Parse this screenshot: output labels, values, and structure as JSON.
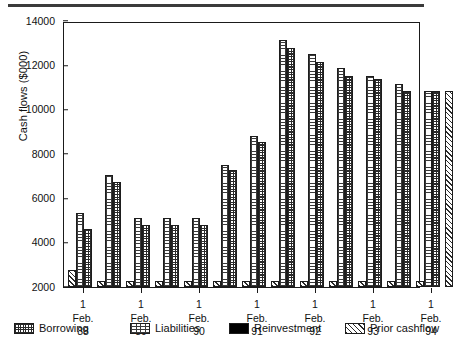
{
  "chart_data": {
    "type": "bar",
    "title": "",
    "xlabel": "",
    "ylabel": "Cash flows ($000)",
    "ylim": [
      2000,
      14000
    ],
    "ytick_values": [
      2000,
      4000,
      6000,
      8000,
      10000,
      12000,
      14000
    ],
    "ytick_labels": [
      "2000",
      "4000",
      "6000",
      "8000",
      "10000",
      "12000",
      "14000"
    ],
    "grid": false,
    "legend_position": "bottom",
    "categories": [
      "1 Feb. 88",
      "",
      "1 Feb. 89",
      "",
      "1 Feb. 90",
      "",
      "1 Feb. 91",
      "",
      "1 Feb. 92",
      "",
      "1 Feb. 93",
      "",
      "1 Feb. 94",
      ""
    ],
    "xtick_labels": [
      "1\nFeb.\n88",
      "1\nFeb.\n89",
      "1\nFeb.\n90",
      "1\nFeb.\n91",
      "1\nFeb.\n92",
      "1\nFeb.\n93",
      "1\nFeb.\n94"
    ],
    "xtick_label_lines": [
      [
        "1",
        "Feb.",
        "88"
      ],
      [
        "1",
        "Feb.",
        "89"
      ],
      [
        "1",
        "Feb.",
        "90"
      ],
      [
        "1",
        "Feb.",
        "91"
      ],
      [
        "1",
        "Feb.",
        "92"
      ],
      [
        "1",
        "Feb.",
        "93"
      ],
      [
        "1",
        "Feb.",
        "94"
      ]
    ],
    "series": [
      {
        "name": "Prior cashflow",
        "pattern": "diagonal-hatch",
        "values": [
          2750,
          2250,
          2250,
          2250,
          2250,
          2250,
          2250,
          2250,
          2250,
          2250,
          2250,
          2250,
          2250,
          10850
        ]
      },
      {
        "name": "Liabilities",
        "pattern": "dotted-grid",
        "values": [
          5350,
          7050,
          5100,
          5100,
          5100,
          7500,
          8800,
          13150,
          12500,
          11900,
          11500,
          11150,
          10850,
          null
        ]
      },
      {
        "name": "Borrowing",
        "pattern": "checkered",
        "values": [
          4600,
          6750,
          4800,
          4800,
          4800,
          7300,
          8550,
          12800,
          12150,
          11500,
          11400,
          10850,
          10850,
          null
        ]
      },
      {
        "name": "Reinvestment",
        "pattern": "solid-black",
        "values": [
          0,
          0,
          0,
          0,
          0,
          0,
          0,
          0,
          0,
          0,
          0,
          0,
          0,
          0
        ]
      }
    ]
  },
  "legend": {
    "items": [
      {
        "label": "Borrowing",
        "swatch": "borrow"
      },
      {
        "label": "Liabilities",
        "swatch": "liab"
      },
      {
        "label": "Reinvestment",
        "swatch": "reinv"
      },
      {
        "label": "Prior cashflow",
        "swatch": "prior"
      }
    ]
  },
  "colors": {
    "axis": "#1a1a1a",
    "ink": "#2a2a2a",
    "background": "#ffffff",
    "reinvestment": "#000000",
    "top_rule": "#3b3b3b"
  }
}
